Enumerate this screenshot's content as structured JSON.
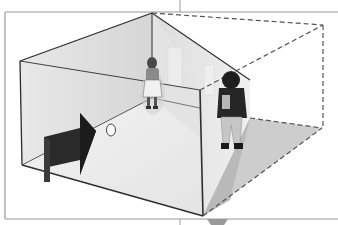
{
  "diagram": {
    "elements": {
      "room": "perspective room with back-left wall, right wall and floor",
      "true_shape_outline": "dashed outline of actual room shape",
      "figure_small": "small-appearing child standing in far corner",
      "figure_large": "large-appearing child standing in near corner",
      "viewer_arrow": "dark arrow indicating viewing direction",
      "peephole": "small circle viewing hole"
    },
    "colors": {
      "line": "#333333",
      "frame": "#999999",
      "wall_left": "#dedede",
      "wall_right": "#e6e6e6",
      "floor": "#eeeeee",
      "shadow_floor": "#cfcfcf",
      "arrow": "#2a2a2a",
      "dashed": "#555555"
    }
  }
}
